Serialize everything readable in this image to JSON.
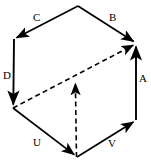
{
  "figure": {
    "kind": "cube-vector-diagram",
    "title": "",
    "background_color": "#ffffff",
    "stroke_color": "#000000"
  },
  "labels": {
    "a": "A",
    "b": "B",
    "c": "C",
    "d": "D",
    "u": "U",
    "v": "V"
  },
  "geometry": {
    "vertices": {
      "top": [
        78,
        6
      ],
      "upper_left": [
        14,
        39
      ],
      "upper_right": [
        136,
        43
      ],
      "lower_left": [
        13,
        108
      ],
      "lower_right": [
        136,
        120
      ],
      "bottom": [
        77,
        157
      ],
      "center": [
        75,
        79
      ]
    },
    "edges": [
      {
        "name": "edge-c",
        "label": "C",
        "from": "top",
        "to": "upper_left",
        "style": "solid",
        "arrow": "to"
      },
      {
        "name": "edge-b",
        "label": "B",
        "from": "top",
        "to": "upper_right",
        "style": "solid",
        "arrow": "to"
      },
      {
        "name": "edge-a",
        "label": "A",
        "from": "lower_right",
        "to": "upper_right",
        "style": "solid",
        "arrow": "to"
      },
      {
        "name": "edge-d",
        "label": "D",
        "from": "upper_left",
        "to": "lower_left",
        "style": "solid",
        "arrow": "to"
      },
      {
        "name": "edge-u",
        "label": "U",
        "from": "lower_left",
        "to": "bottom",
        "style": "solid",
        "arrow": "to"
      },
      {
        "name": "edge-v",
        "label": "V",
        "from": "bottom",
        "to": "lower_right",
        "style": "solid",
        "arrow": "to"
      },
      {
        "name": "diagonal-dashed",
        "label": "",
        "from": "lower_left",
        "to": "upper_right",
        "style": "dashed",
        "arrow": "to"
      },
      {
        "name": "vertical-dashed",
        "label": "",
        "from": "bottom",
        "to": "center",
        "style": "dashed",
        "arrow": "to"
      }
    ]
  }
}
